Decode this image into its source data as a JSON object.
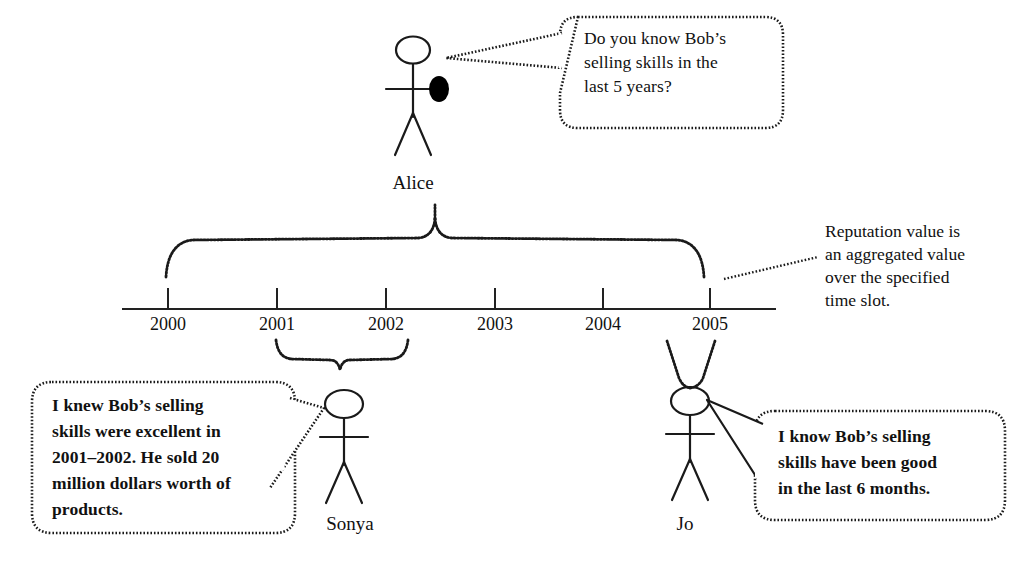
{
  "diagram": {
    "background_color": "#ffffff",
    "ink_color": "#111111"
  },
  "actors": [
    {
      "id": "alice",
      "name": "Alice",
      "has_hand_marker": true,
      "marker_color": "#000000"
    },
    {
      "id": "sonya",
      "name": "Sonya",
      "has_hand_marker": false
    },
    {
      "id": "jo",
      "name": "Jo",
      "has_hand_marker": false
    }
  ],
  "speech_bubbles": [
    {
      "id": "alice-question",
      "speaker": "Alice",
      "bold": false,
      "lines": [
        "Do you know Bob’s",
        "selling skills in the",
        "last 5 years?"
      ]
    },
    {
      "id": "sonya-answer",
      "speaker": "Sonya",
      "bold": true,
      "lines": [
        "I knew Bob’s selling",
        "skills were excellent in",
        "2001–2002. He sold 20",
        "million dollars worth of",
        "products."
      ]
    },
    {
      "id": "jo-answer",
      "speaker": "Jo",
      "bold": true,
      "lines": [
        "I know Bob’s selling",
        "skills have been good",
        "in the last 6 months."
      ]
    }
  ],
  "annotation": {
    "id": "reputation-note",
    "lines": [
      "Reputation value is",
      "an aggregated value",
      "over the specified",
      "time slot."
    ],
    "has_leader_line": true
  },
  "timeline": {
    "axis_label": "",
    "years": [
      "2000",
      "2001",
      "2002",
      "2003",
      "2004",
      "2005"
    ],
    "tick_positions_px": [
      168,
      277,
      386,
      495,
      603,
      710
    ],
    "axis_start_px": 122,
    "axis_end_px": 776,
    "axis_y_px": 309
  },
  "braces": [
    {
      "id": "alice-brace",
      "owner": "Alice",
      "direction": "up",
      "span_years": [
        "2000",
        "2005"
      ],
      "label": "last 5 years"
    },
    {
      "id": "sonya-brace",
      "owner": "Sonya",
      "direction": "down",
      "span_years": [
        "2001",
        "2002"
      ],
      "label": "2001–2002"
    },
    {
      "id": "jo-brace",
      "owner": "Jo",
      "direction": "down",
      "span_years": [
        "2005",
        "2005"
      ],
      "label": "last 6 months"
    }
  ]
}
